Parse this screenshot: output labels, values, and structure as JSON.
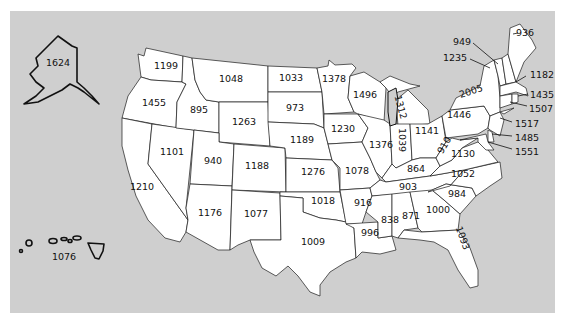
{
  "map": {
    "title": "",
    "background_color": "#cfcfcf",
    "land_color": "#ffffff",
    "states": [
      {
        "name": "Alaska",
        "value": "1624"
      },
      {
        "name": "Hawaii",
        "value": "1076"
      },
      {
        "name": "Washington",
        "value": "1199"
      },
      {
        "name": "Oregon",
        "value": "1455"
      },
      {
        "name": "California",
        "value": "1210"
      },
      {
        "name": "Nevada",
        "value": "1101"
      },
      {
        "name": "Idaho",
        "value": "895"
      },
      {
        "name": "Montana",
        "value": "1048"
      },
      {
        "name": "Wyoming",
        "value": "1263"
      },
      {
        "name": "Utah",
        "value": "940"
      },
      {
        "name": "Arizona",
        "value": "1176"
      },
      {
        "name": "Colorado",
        "value": "1188"
      },
      {
        "name": "New Mexico",
        "value": "1077"
      },
      {
        "name": "North Dakota",
        "value": "1033"
      },
      {
        "name": "South Dakota",
        "value": "973"
      },
      {
        "name": "Nebraska",
        "value": "1189"
      },
      {
        "name": "Kansas",
        "value": "1276"
      },
      {
        "name": "Oklahoma",
        "value": "1018"
      },
      {
        "name": "Texas",
        "value": "1009"
      },
      {
        "name": "Minnesota",
        "value": "1378"
      },
      {
        "name": "Iowa",
        "value": "1230"
      },
      {
        "name": "Missouri",
        "value": "1078"
      },
      {
        "name": "Arkansas",
        "value": "916"
      },
      {
        "name": "Louisiana",
        "value": "996"
      },
      {
        "name": "Wisconsin",
        "value": "1496"
      },
      {
        "name": "Illinois",
        "value": "1376"
      },
      {
        "name": "Michigan",
        "value": "1312"
      },
      {
        "name": "Indiana",
        "value": "1039"
      },
      {
        "name": "Ohio",
        "value": "1141"
      },
      {
        "name": "Kentucky",
        "value": "864"
      },
      {
        "name": "Tennessee",
        "value": "903"
      },
      {
        "name": "Mississippi",
        "value": "838"
      },
      {
        "name": "Alabama",
        "value": "871"
      },
      {
        "name": "Georgia",
        "value": "1000"
      },
      {
        "name": "Florida",
        "value": "1093"
      },
      {
        "name": "South Carolina",
        "value": "984"
      },
      {
        "name": "North Carolina",
        "value": "1052"
      },
      {
        "name": "Virginia",
        "value": "1130"
      },
      {
        "name": "West Virginia",
        "value": "910"
      },
      {
        "name": "Pennsylvania",
        "value": "1446"
      },
      {
        "name": "New York",
        "value": "2005"
      },
      {
        "name": "Vermont",
        "value": "949"
      },
      {
        "name": "New Hampshire",
        "value": "1235"
      },
      {
        "name": "Maine",
        "value": "936"
      },
      {
        "name": "Massachusetts",
        "value": "1182"
      },
      {
        "name": "Rhode Island",
        "value": "1435"
      },
      {
        "name": "Connecticut",
        "value": "1507"
      },
      {
        "name": "New Jersey",
        "value": "1517"
      },
      {
        "name": "Delaware",
        "value": "1485"
      },
      {
        "name": "Maryland",
        "value": "1551"
      }
    ]
  }
}
